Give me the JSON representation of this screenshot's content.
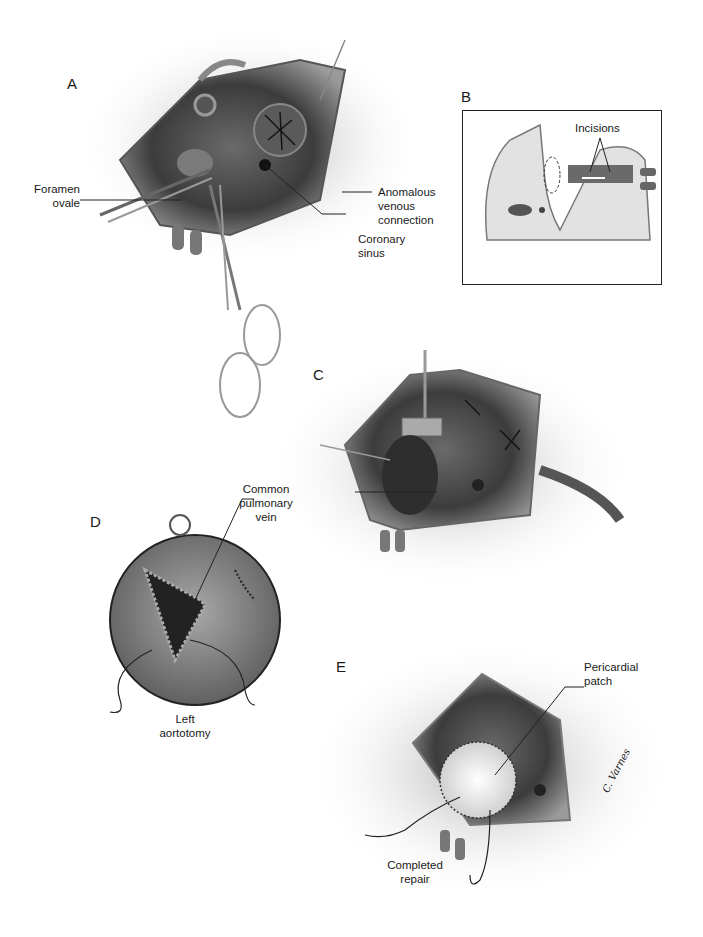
{
  "figure": {
    "panels": [
      {
        "id": "A",
        "letter": "A",
        "labels": [
          "Foramen ovale",
          "Anomalous venous connection",
          "Coronary sinus"
        ]
      },
      {
        "id": "B",
        "letter": "B",
        "labels": [
          "Incisions"
        ]
      },
      {
        "id": "C",
        "letter": "C",
        "labels": [
          "Common pulmonary vein"
        ]
      },
      {
        "id": "D",
        "letter": "D",
        "labels": [
          "Left aortotomy"
        ]
      },
      {
        "id": "E",
        "letter": "E",
        "labels": [
          "Pericardial patch",
          "Completed repair"
        ]
      }
    ],
    "text": {
      "a_letter": "A",
      "a_foramen_1": "Foramen",
      "a_foramen_2": "ovale",
      "a_anom_1": "Anomalous",
      "a_anom_2": "venous",
      "a_anom_3": "connection",
      "a_coronary_1": "Coronary",
      "a_coronary_2": "sinus",
      "b_letter": "B",
      "b_incisions": "Incisions",
      "c_letter": "C",
      "c_common_1": "Common",
      "c_common_2": "pulmonary",
      "c_common_3": "vein",
      "d_letter": "D",
      "d_left_1": "Left",
      "d_left_2": "aortotomy",
      "e_letter": "E",
      "e_peri_1": "Pericardial",
      "e_peri_2": "patch",
      "e_completed_1": "Completed",
      "e_completed_2": "repair",
      "signature": "C. Varnes"
    },
    "colors": {
      "ink": "#1a1a1a",
      "tissue_dark": "#4a4a4a",
      "tissue_mid": "#8a8a8a",
      "tissue_light": "#cfcfcf",
      "background": "#ffffff"
    }
  }
}
